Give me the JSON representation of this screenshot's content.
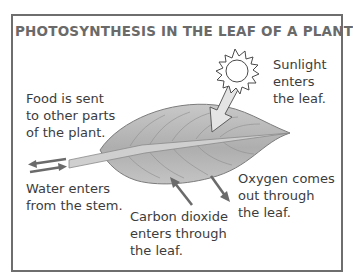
{
  "diagram": {
    "title": "PHOTOSYNTHESIS IN THE LEAF OF A PLANT",
    "labels": {
      "sunlight": "Sunlight\nenters\nthe leaf.",
      "food": "Food is sent\nto other parts\nof the plant.",
      "water": "Water enters\nfrom the stem.",
      "carbon_dioxide": "Carbon dioxide\nenters through\nthe leaf.",
      "oxygen": "Oxygen comes\nout through\nthe leaf."
    },
    "icons": [
      "sun-icon",
      "leaf-illustration",
      "arrow-icon"
    ],
    "colors": {
      "frame": "#6e6e6e",
      "title": "#6a6a6a",
      "leaf_fill": "#b9b9b9",
      "leaf_vein": "#8a8a8a",
      "arrow": "#6b6b6b"
    }
  }
}
